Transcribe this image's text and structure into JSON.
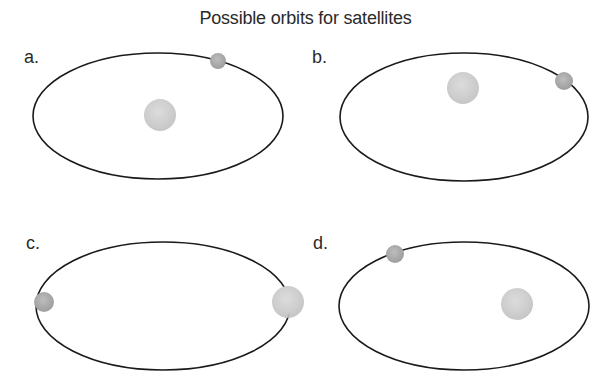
{
  "title": "Possible orbits for satellites",
  "colors": {
    "orbit_line": "#1a1a1a",
    "planet_fill": "#cfcfcf",
    "satellite_fill": "#a9a9a9",
    "background": "#ffffff"
  },
  "panels": [
    {
      "label": "a.",
      "orbit": {
        "cx": 158,
        "cy": 116,
        "rx": 125,
        "ry": 63
      },
      "planet": {
        "cx": 160,
        "cy": 115,
        "r": 16,
        "position": "center of orbit"
      },
      "satellite": {
        "cx": 218,
        "cy": 61,
        "r": 8,
        "position": "top of orbit"
      }
    },
    {
      "label": "b.",
      "orbit": {
        "cx": 464,
        "cy": 117,
        "rx": 124,
        "ry": 64
      },
      "planet": {
        "cx": 463,
        "cy": 88,
        "r": 16,
        "position": "above center, off-axis"
      },
      "satellite": {
        "cx": 564,
        "cy": 81,
        "r": 9,
        "position": "upper right of orbit"
      }
    },
    {
      "label": "c.",
      "orbit": {
        "cx": 163,
        "cy": 306,
        "rx": 127,
        "ry": 64
      },
      "planet": {
        "cx": 288,
        "cy": 302,
        "r": 16,
        "position": "on right end of orbit"
      },
      "satellite": {
        "cx": 44,
        "cy": 302,
        "r": 10,
        "position": "left end of orbit"
      }
    },
    {
      "label": "d.",
      "orbit": {
        "cx": 464,
        "cy": 306,
        "rx": 125,
        "ry": 64
      },
      "planet": {
        "cx": 517,
        "cy": 304,
        "r": 16,
        "position": "right focus"
      },
      "satellite": {
        "cx": 395,
        "cy": 254,
        "r": 9,
        "position": "upper left of orbit"
      }
    }
  ]
}
